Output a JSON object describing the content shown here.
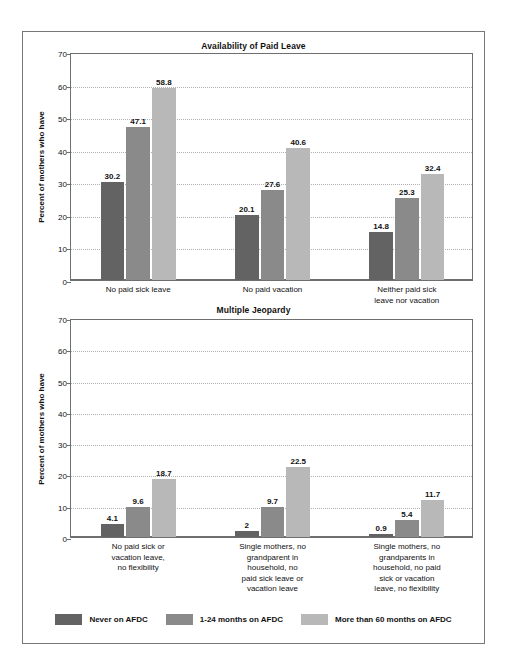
{
  "figure": {
    "series": [
      {
        "name": "Never on AFDC",
        "color": "#636363"
      },
      {
        "name": "1-24 months on AFDC",
        "color": "#8a8a8a"
      },
      {
        "name": "More than 60 months on AFDC",
        "color": "#b8b8b8"
      }
    ],
    "legend": {
      "items": [
        {
          "label": "Never on AFDC",
          "color": "#636363"
        },
        {
          "label": "1-24 months on AFDC",
          "color": "#8a8a8a"
        },
        {
          "label": "More than 60 months on AFDC",
          "color": "#b8b8b8"
        }
      ]
    }
  },
  "chart_data": [
    {
      "type": "bar",
      "title": "Availability of Paid Leave",
      "xlabel": "",
      "ylabel": "Percent of mothers who have",
      "ylim": [
        0,
        70
      ],
      "yticks": [
        0,
        10,
        20,
        30,
        40,
        50,
        60,
        70
      ],
      "grid": true,
      "legend_position": "bottom",
      "categories": [
        "No paid sick leave",
        "No paid vacation",
        "Neither paid sick\nleave nor vacation"
      ],
      "category_lines": [
        [
          "No paid sick leave"
        ],
        [
          "No paid vacation"
        ],
        [
          "Neither paid sick",
          "leave nor vacation"
        ]
      ],
      "series": [
        {
          "name": "Never on AFDC",
          "color": "#636363",
          "values": [
            30.2,
            20.1,
            14.8
          ]
        },
        {
          "name": "1-24 months on AFDC",
          "color": "#8a8a8a",
          "values": [
            47.1,
            27.6,
            25.3
          ]
        },
        {
          "name": "More than 60 months on AFDC",
          "color": "#b8b8b8",
          "values": [
            58.8,
            40.6,
            32.4
          ]
        }
      ]
    },
    {
      "type": "bar",
      "title": "Multiple Jeopardy",
      "xlabel": "",
      "ylabel": "Percent of mothers who have",
      "ylim": [
        0,
        70
      ],
      "yticks": [
        0,
        10,
        20,
        30,
        40,
        50,
        60,
        70
      ],
      "grid": true,
      "legend_position": "bottom",
      "categories": [
        "No paid sick or\nvacation leave,\nno flexibility",
        "Single mothers, no\ngrandparent in\nhousehold, no\npaid sick leave or\nvacation leave",
        "Single mothers, no\ngrandparents in\nhousehold, no paid\nsick or vacation\nleave, no flexibility"
      ],
      "category_lines": [
        [
          "No paid sick or",
          "vacation leave,",
          "no flexibility"
        ],
        [
          "Single mothers, no",
          "grandparent in",
          "household, no",
          "paid sick leave or",
          "vacation leave"
        ],
        [
          "Single mothers, no",
          "grandparents in",
          "household, no paid",
          "sick or vacation",
          "leave, no flexibility"
        ]
      ],
      "series": [
        {
          "name": "Never on AFDC",
          "color": "#636363",
          "values": [
            4.1,
            2,
            0.9
          ]
        },
        {
          "name": "1-24 months on AFDC",
          "color": "#8a8a8a",
          "values": [
            9.6,
            9.7,
            5.4
          ]
        },
        {
          "name": "More than 60 months on AFDC",
          "color": "#b8b8b8",
          "values": [
            18.7,
            22.5,
            11.7
          ]
        }
      ],
      "value_labels": [
        [
          "4.1",
          "9.6",
          "18.7"
        ],
        [
          "2",
          "9.7",
          "22.5"
        ],
        [
          "0.9",
          "5.4",
          "11.7"
        ]
      ]
    }
  ]
}
